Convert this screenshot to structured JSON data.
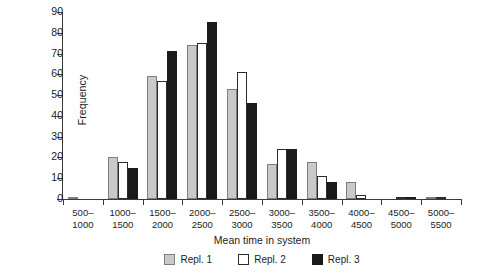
{
  "chart_data": {
    "type": "bar",
    "title": "",
    "xlabel": "Mean time in system",
    "ylabel": "Frequency",
    "categories": [
      "500-\n1000",
      "1000-\n1500",
      "1500-\n2000",
      "2000-\n2500",
      "2500-\n3000",
      "3000-\n3500",
      "3500-\n4000",
      "4000-\n4500",
      "4500-\n5000",
      "5000-\n5500"
    ],
    "category_lines": [
      [
        "500–",
        "1000"
      ],
      [
        "1000–",
        "1500"
      ],
      [
        "1500–",
        "2000"
      ],
      [
        "2000–",
        "2500"
      ],
      [
        "2500–",
        "3000"
      ],
      [
        "3000–",
        "3500"
      ],
      [
        "3500–",
        "4000"
      ],
      [
        "4000–",
        "4500"
      ],
      [
        "4500–",
        "5000"
      ],
      [
        "5000–",
        "5500"
      ]
    ],
    "series": [
      {
        "name": "Repl. 1",
        "color": "#c9c9c9",
        "values": [
          1,
          20,
          59,
          74,
          53,
          17,
          18,
          8,
          0,
          1
        ]
      },
      {
        "name": "Repl. 2",
        "color": "#ffffff",
        "values": [
          0,
          18,
          57,
          75,
          61,
          24,
          11,
          2,
          1,
          1
        ]
      },
      {
        "name": "Repl. 3",
        "color": "#1a1a1a",
        "values": [
          0,
          15,
          71,
          85,
          46,
          24,
          8,
          0,
          1,
          0
        ]
      }
    ],
    "ylim": [
      0,
      90
    ],
    "yticks": [
      0,
      10,
      20,
      30,
      40,
      50,
      60,
      70,
      80,
      90
    ],
    "ytick_labels": [
      "0",
      "10",
      "20",
      "30",
      "40",
      "50",
      "60",
      "70",
      "80",
      "90"
    ],
    "grid": false,
    "legend_position": "bottom"
  },
  "legend": {
    "items": [
      {
        "label": "Repl. 1",
        "swatch": "gray-swatch"
      },
      {
        "label": "Repl. 2",
        "swatch": "white-swatch"
      },
      {
        "label": "Repl. 3",
        "swatch": "black-swatch"
      }
    ]
  }
}
